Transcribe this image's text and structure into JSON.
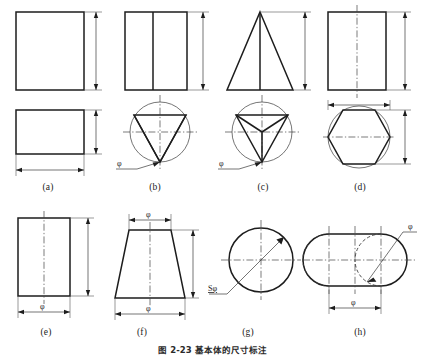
{
  "figure": {
    "caption": "图 2-23  基本体的尺寸标注",
    "panel_labels": [
      "(a)",
      "(b)",
      "(c)",
      "(d)",
      "(e)",
      "(f)",
      "(g)",
      "(h)"
    ],
    "symbols": {
      "diameter": "φ",
      "sphere_diameter": "Sφ"
    },
    "panels": [
      {
        "key": "a",
        "label": "(a)",
        "name": "rectangular-prism",
        "views": [
          "front-view-rectangle",
          "top-view-rectangle"
        ],
        "dimensions": [
          "height",
          "width",
          "depth"
        ],
        "dimension_labels": []
      },
      {
        "key": "b",
        "label": "(b)",
        "name": "triangular-prism",
        "views": [
          "front-view-rectangle-with-edge",
          "top-view-triangle-in-circle"
        ],
        "dimensions": [
          "height",
          "diameter"
        ],
        "dimension_labels": [
          "φ"
        ]
      },
      {
        "key": "c",
        "label": "(c)",
        "name": "triangular-pyramid",
        "views": [
          "front-view-triangle",
          "top-view-pyramid-in-circle"
        ],
        "dimensions": [
          "height",
          "diameter"
        ],
        "dimension_labels": [
          "φ"
        ]
      },
      {
        "key": "d",
        "label": "(d)",
        "name": "hexagonal-prism",
        "views": [
          "front-view-rectangle-centerline",
          "top-view-hexagon-in-circle"
        ],
        "dimensions": [
          "height",
          "across-flats",
          "across-corners"
        ],
        "dimension_labels": []
      },
      {
        "key": "e",
        "label": "(e)",
        "name": "cylinder",
        "views": [
          "front-view-rectangle-centerline"
        ],
        "dimensions": [
          "height",
          "diameter"
        ],
        "dimension_labels": [
          "φ"
        ]
      },
      {
        "key": "f",
        "label": "(f)",
        "name": "truncated-cone",
        "views": [
          "front-view-trapezoid-centerline"
        ],
        "dimensions": [
          "top-diameter",
          "bottom-diameter",
          "height"
        ],
        "dimension_labels": [
          "φ",
          "φ"
        ]
      },
      {
        "key": "g",
        "label": "(g)",
        "name": "sphere",
        "views": [
          "front-view-circle-centerlines"
        ],
        "dimensions": [
          "sphere-diameter"
        ],
        "dimension_labels": [
          "Sφ"
        ]
      },
      {
        "key": "h",
        "label": "(h)",
        "name": "cylinder-with-spherical-ends",
        "views": [
          "front-view-stadium-with-hidden-arcs"
        ],
        "dimensions": [
          "diameter",
          "length"
        ],
        "dimension_labels": [
          "φ",
          "φ"
        ]
      }
    ]
  }
}
